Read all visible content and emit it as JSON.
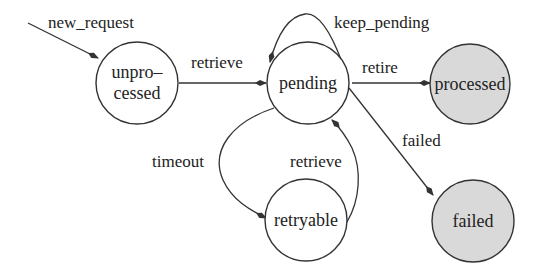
{
  "diagram": {
    "type": "state-machine",
    "states": [
      {
        "id": "unprocessed",
        "label_line1": "unpro–",
        "label_line2": "cessed",
        "final": false
      },
      {
        "id": "pending",
        "label": "pending",
        "final": false
      },
      {
        "id": "processed",
        "label": "processed",
        "final": true
      },
      {
        "id": "retryable",
        "label": "retryable",
        "final": false
      },
      {
        "id": "failed",
        "label": "failed",
        "final": true
      }
    ],
    "transitions": [
      {
        "from": "start",
        "to": "unprocessed",
        "label": "new_request"
      },
      {
        "from": "unprocessed",
        "to": "pending",
        "label": "retrieve"
      },
      {
        "from": "pending",
        "to": "pending",
        "label": "keep_pending"
      },
      {
        "from": "pending",
        "to": "processed",
        "label": "retire"
      },
      {
        "from": "pending",
        "to": "failed",
        "label": "failed"
      },
      {
        "from": "pending",
        "to": "retryable",
        "label": "timeout"
      },
      {
        "from": "retryable",
        "to": "pending",
        "label": "retrieve"
      }
    ],
    "colors": {
      "final_state_fill": "#d9d9d9",
      "state_fill": "#ffffff",
      "stroke": "#333333"
    }
  }
}
